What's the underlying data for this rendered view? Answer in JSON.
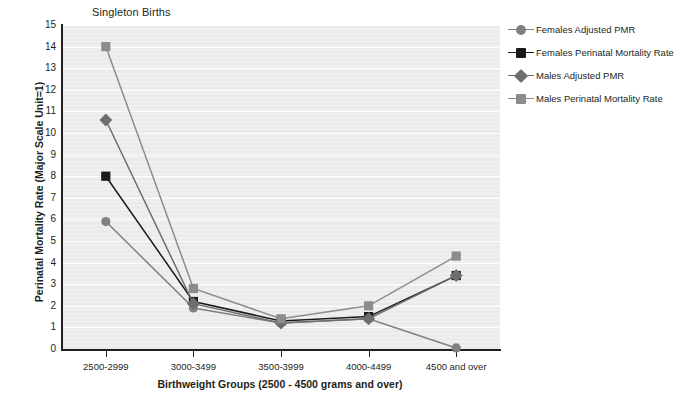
{
  "chart_data": {
    "type": "line",
    "title": "Singleton Births",
    "xlabel": "Birthweight Groups (2500 - 4500 grams and over)",
    "ylabel": "Perinatal Mortality Rate (Major Scale Unit=1)",
    "categories": [
      "2500-2999",
      "3000-3499",
      "3500-3999",
      "4000-4499",
      "4500 and over"
    ],
    "ylim": [
      0,
      15
    ],
    "yticks": [
      0,
      1,
      2,
      3,
      4,
      5,
      6,
      7,
      8,
      9,
      10,
      11,
      12,
      13,
      14,
      15
    ],
    "grid": true,
    "legend_position": "right",
    "series": [
      {
        "name": "Females Adjusted PMR",
        "marker": "circle",
        "color": "#808080",
        "values": [
          5.9,
          1.9,
          1.2,
          1.4,
          0.05
        ]
      },
      {
        "name": "Females Perinatal Mortality Rate",
        "marker": "square",
        "color": "#1a1a1a",
        "values": [
          8.0,
          2.2,
          1.3,
          1.5,
          3.4
        ]
      },
      {
        "name": "Males Adjusted PMR",
        "marker": "diamond",
        "color": "#6e6e6e",
        "values": [
          10.6,
          2.1,
          1.2,
          1.4,
          3.4
        ]
      },
      {
        "name": "Males Perinatal Mortality Rate",
        "marker": "square",
        "color": "#8c8c8c",
        "values": [
          14.0,
          2.8,
          1.4,
          2.0,
          4.3
        ]
      }
    ]
  },
  "colors": {
    "plot_background": "#ebebeb",
    "gridline": "#ffffff",
    "axis": "#231f20",
    "text": "#231f20"
  }
}
